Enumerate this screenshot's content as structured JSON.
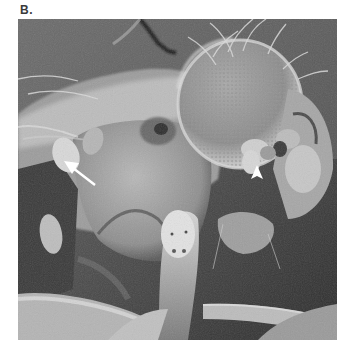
{
  "figure": {
    "panel_label": "B.",
    "image": {
      "type": "scanning electron micrograph",
      "subject": "fly head and thorax, lateral view",
      "grayscale": true
    },
    "annotations": [
      {
        "name": "arrow",
        "color": "#ffffff",
        "points_to": "swollen structure on left of head",
        "style": "line arrow"
      },
      {
        "name": "arrowhead",
        "color": "#ffffff",
        "points_to": "antenna on compound eye",
        "style": "arrowhead"
      }
    ],
    "colors": {
      "background": "#ffffff",
      "label": "#3a3a3a",
      "sem_dark": "#2a2a2a",
      "sem_mid": "#7a7a7a",
      "sem_light": "#d8d8d8"
    }
  }
}
